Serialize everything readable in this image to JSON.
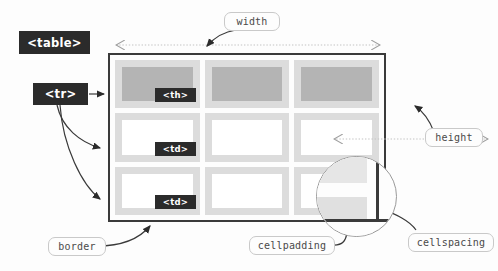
{
  "diagram": {
    "background_color": "#fdfdfd"
  },
  "tags": [
    {
      "id": "table",
      "label": "<table>"
    },
    {
      "id": "tr",
      "label": "<tr>"
    },
    {
      "id": "th",
      "label": "<th>"
    },
    {
      "id": "td1",
      "label": "<td>"
    },
    {
      "id": "td2",
      "label": "<td>"
    }
  ],
  "attributes": [
    {
      "id": "width",
      "label": "width"
    },
    {
      "id": "height",
      "label": "height"
    },
    {
      "id": "border",
      "label": "border"
    },
    {
      "id": "cellpadding",
      "label": "cellpadding"
    },
    {
      "id": "cellspacing",
      "label": "cellspacing"
    }
  ],
  "table": {
    "rows": 3,
    "columns": 3,
    "header_row_index": 0,
    "cell_types": [
      [
        "th",
        "th",
        "th"
      ],
      [
        "td",
        "td",
        "td"
      ],
      [
        "td",
        "td",
        "td"
      ]
    ]
  },
  "colors": {
    "tag_chip_background": "#2b2b2b",
    "tag_chip_text": "#ffffff",
    "pill_border": "#c9c9c9",
    "pill_text": "#4a4a4a",
    "table_border": "#3a3a3a",
    "cell_spacing_fill": "#dcdcdc",
    "header_cell_fill": "#b4b4b4",
    "data_cell_fill": "#ffffff",
    "arrow": "#2b2b2b",
    "dimension_line": "#bdbdbd"
  }
}
